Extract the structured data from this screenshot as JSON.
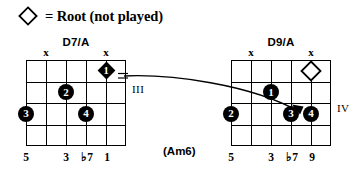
{
  "legend": {
    "symbol": "root-diamond-outline",
    "text": "= Root (not played)"
  },
  "diagrams": [
    {
      "id": "chord-left",
      "name": "D7/A",
      "position_marker": "III",
      "strings": 6,
      "frets": 4,
      "muted_strings": [
        2,
        6
      ],
      "markers": [
        {
          "type": "diamond-filled",
          "label": "1",
          "string": 5,
          "fret": 1
        },
        {
          "type": "dot",
          "label": "2",
          "string": 3,
          "fret": 2
        },
        {
          "type": "dot",
          "label": "3",
          "string": 1,
          "fret": 3
        },
        {
          "type": "dot",
          "label": "4",
          "string": 4,
          "fret": 3
        }
      ],
      "interval_labels": [
        {
          "string": 1,
          "text": "5"
        },
        {
          "string": 3,
          "text": "3"
        },
        {
          "string": 4,
          "text": "♭7"
        },
        {
          "string": 5,
          "text": "1"
        }
      ]
    },
    {
      "id": "chord-right",
      "name": "D9/A",
      "position_marker": "IV",
      "strings": 6,
      "frets": 4,
      "muted_strings": [
        2,
        6
      ],
      "markers": [
        {
          "type": "diamond-outline",
          "label": "",
          "string": 5,
          "fret": 1
        },
        {
          "type": "dot",
          "label": "1",
          "string": 3,
          "fret": 2
        },
        {
          "type": "dot",
          "label": "2",
          "string": 1,
          "fret": 3
        },
        {
          "type": "dot",
          "label": "3",
          "string": 4,
          "fret": 3
        },
        {
          "type": "dot",
          "label": "4",
          "string": 5,
          "fret": 3
        }
      ],
      "interval_labels": [
        {
          "string": 1,
          "text": "5"
        },
        {
          "string": 3,
          "text": "3"
        },
        {
          "string": 4,
          "text": "♭7"
        },
        {
          "string": 5,
          "text": "9"
        }
      ]
    }
  ],
  "alt_name": "(Am6)",
  "colors": {
    "ink": "#000000",
    "background": "#ffffff"
  }
}
